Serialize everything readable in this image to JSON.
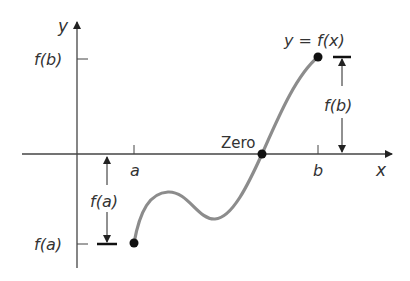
{
  "diagram": {
    "axes": {
      "x_label": "x",
      "y_label": "y"
    },
    "ticks": {
      "a": "a",
      "b": "b",
      "fa_axis": "f(a)",
      "fb_axis": "f(b)"
    },
    "curve_label": "y = f(x)",
    "zero_label": "Zero",
    "measures": {
      "fa": "f(a)",
      "fb": "f(b)"
    },
    "colors": {
      "axis": "#333333",
      "curve": "#8c8c8c",
      "point": "#111111",
      "text": "#333333"
    }
  }
}
